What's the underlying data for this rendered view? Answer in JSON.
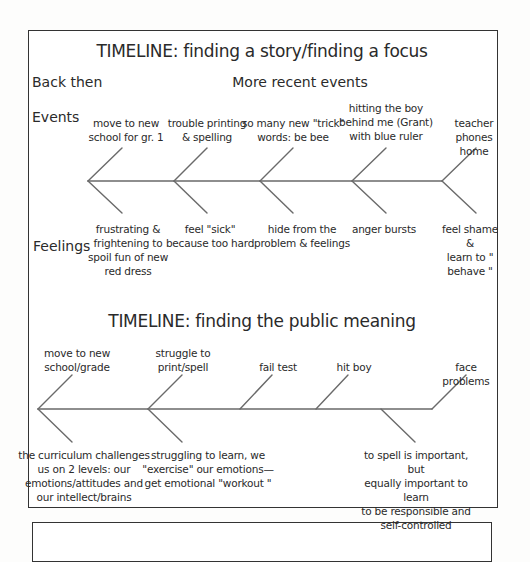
{
  "timeline_story": {
    "title": "TIMELINE: finding a story/finding a focus",
    "header_left": "Back then",
    "header_right": "More recent events",
    "row_events_label": "Events",
    "row_feelings_label": "Feelings",
    "events": [
      "move to new\nschool for gr. 1",
      "trouble printing\n& spelling",
      "so many new  \"trick\"\nwords: be bee",
      "hitting the boy\nbehind me (Grant)\nwith blue ruler",
      "teacher phones\nhome"
    ],
    "feelings": [
      "frustrating &\nfrightening to\nspoil fun of new\nred dress",
      "feel  \"sick\"\nbecause too hard",
      "hide from the\nproblem & feelings",
      "anger bursts",
      "feel shame &\nlearn to \" behave \""
    ]
  },
  "timeline_public": {
    "title": "TIMELINE: finding the public meaning",
    "events": [
      "move to new\nschool/grade",
      "struggle to\nprint/spell",
      "fail test",
      "hit boy",
      "face problems"
    ],
    "meanings": [
      "the curriculum challenges\nus on 2 levels: our\nemotions/attitudes and\nour intellect/brains",
      "struggling to learn, we\n\"exercise\"  our emotions—\nget emotional  \"workout \"",
      "to spell is important, but\nequally important to learn\nto be responsible and\nself-controlled"
    ]
  },
  "colors": {
    "line": "#6a6a6a",
    "frame": "#333333",
    "text": "#2a2a2a"
  }
}
